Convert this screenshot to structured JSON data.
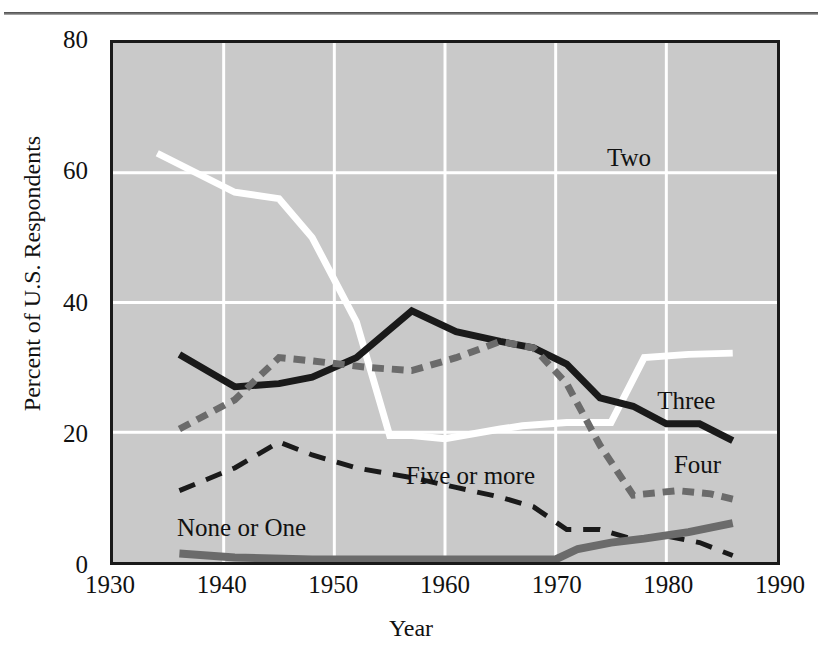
{
  "figure": {
    "top_clipped_text": "",
    "axis_color": "#1a1a1a",
    "plot_background": "#c9c9c9",
    "gridline_color": "#ffffff"
  },
  "yticks": [
    {
      "value": 80,
      "label": "80"
    },
    {
      "value": 60,
      "label": "60"
    },
    {
      "value": 40,
      "label": "40"
    },
    {
      "value": 20,
      "label": "20"
    },
    {
      "value": 0,
      "label": "0"
    }
  ],
  "xticks": [
    {
      "value": 1930,
      "label": "1930"
    },
    {
      "value": 1940,
      "label": "1940"
    },
    {
      "value": 1950,
      "label": "1950"
    },
    {
      "value": 1960,
      "label": "1960"
    },
    {
      "value": 1970,
      "label": "1970"
    },
    {
      "value": 1980,
      "label": "1980"
    },
    {
      "value": 1990,
      "label": "1990"
    }
  ],
  "annotations": [
    {
      "text": "Two",
      "x": 1974.5,
      "y": 62.0
    },
    {
      "text": "Three",
      "x": 1979.0,
      "y": 25.0
    },
    {
      "text": "Four",
      "x": 1980.5,
      "y": 15.2
    },
    {
      "text": "Five or more",
      "x": 1956.5,
      "y": 13.5
    },
    {
      "text": "None or One",
      "x": 1936.0,
      "y": 5.6
    }
  ],
  "chart_data": {
    "type": "line",
    "title": "",
    "xlabel": "Year",
    "ylabel": "Percent of U.S. Respondents",
    "xlim": [
      1930,
      1990
    ],
    "ylim": [
      0,
      80
    ],
    "grid": true,
    "legend_position": "inline-annotations",
    "series": [
      {
        "name": "Two",
        "color": "#ffffff",
        "style": "solid",
        "width": 7,
        "x": [
          1934,
          1941,
          1945,
          1948,
          1952,
          1955,
          1957,
          1960,
          1965,
          1967,
          1971,
          1973,
          1975,
          1978,
          1982,
          1986
        ],
        "y": [
          63.0,
          57.0,
          56.0,
          50.0,
          37.0,
          19.5,
          19.5,
          19.0,
          20.5,
          21.0,
          21.5,
          21.5,
          21.5,
          31.5,
          32.0,
          32.2
        ]
      },
      {
        "name": "Three",
        "color": "#1a1a1a",
        "style": "solid",
        "width": 7,
        "x": [
          1936,
          1941,
          1945,
          1948,
          1952,
          1957,
          1961,
          1965,
          1968,
          1971,
          1974,
          1977,
          1980,
          1983,
          1986
        ],
        "y": [
          32.0,
          27.0,
          27.5,
          28.5,
          31.5,
          38.7,
          35.5,
          34.0,
          33.0,
          30.5,
          25.3,
          24.0,
          21.3,
          21.3,
          18.7
        ]
      },
      {
        "name": "Four",
        "color": "#6b6b6b",
        "style": "dashed",
        "width": 7,
        "x": [
          1936,
          1941,
          1945,
          1948,
          1953,
          1957,
          1961,
          1965,
          1968,
          1971,
          1974,
          1977,
          1981,
          1984,
          1986
        ],
        "y": [
          20.5,
          25.0,
          31.5,
          31.0,
          30.0,
          29.5,
          31.5,
          34.0,
          33.0,
          27.5,
          18.0,
          10.3,
          11.0,
          10.5,
          9.7
        ]
      },
      {
        "name": "Five or more",
        "color": "#1a1a1a",
        "style": "long-dash",
        "width": 5,
        "x": [
          1936,
          1941,
          1945,
          1948,
          1952,
          1957,
          1961,
          1965,
          1968,
          1971,
          1974,
          1977,
          1980,
          1983,
          1986
        ],
        "y": [
          11.0,
          14.5,
          18.5,
          16.5,
          14.5,
          13.0,
          11.5,
          10.0,
          8.5,
          5.0,
          5.0,
          3.5,
          4.0,
          3.0,
          1.0
        ]
      },
      {
        "name": "None or One",
        "color": "#6b6b6b",
        "style": "solid",
        "width": 8,
        "x": [
          1936,
          1941,
          1948,
          1957,
          1965,
          1970,
          1972,
          1975,
          1978,
          1982,
          1986
        ],
        "y": [
          1.3,
          0.7,
          0.4,
          0.4,
          0.4,
          0.4,
          2.0,
          3.0,
          3.6,
          4.6,
          6.0
        ]
      }
    ]
  }
}
